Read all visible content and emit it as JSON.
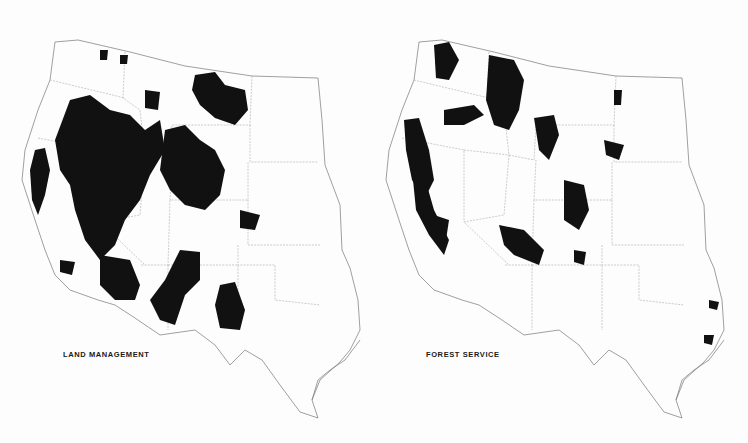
{
  "figure": {
    "maps": [
      {
        "id": "land-management",
        "label": "LAND MANAGEMENT",
        "fill_color": "#111111"
      },
      {
        "id": "forest-service",
        "label": "FOREST SERVICE",
        "fill_color": "#111111"
      }
    ],
    "region": "Western United States",
    "background_color": "#fdfdfd",
    "outline_color": "#777777"
  }
}
